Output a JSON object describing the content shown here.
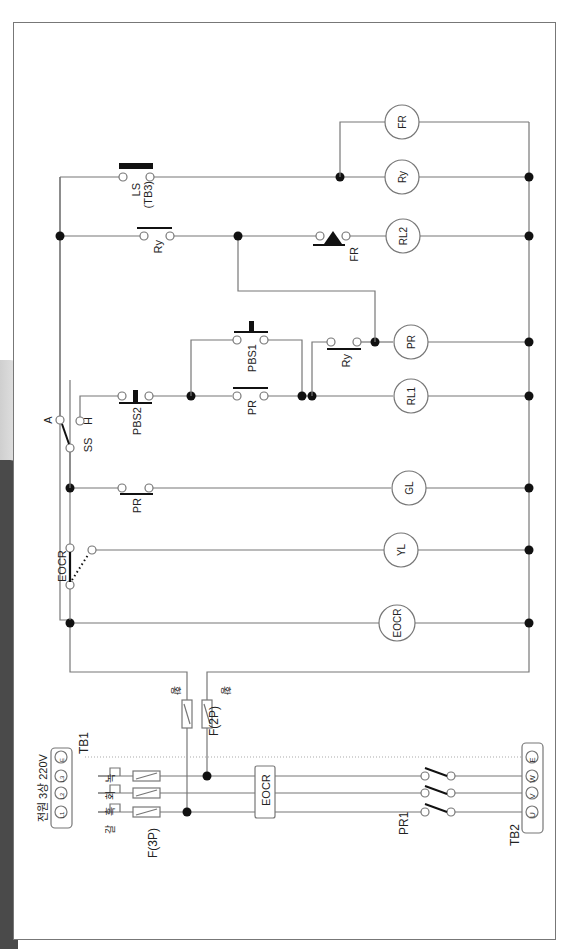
{
  "diagram": {
    "type": "electrical control circuit (sequence diagram, rotated 90°)",
    "power_supply": {
      "label": "전원 3상 220V",
      "terminal_block": "TB1",
      "terminals": [
        "L1",
        "L2",
        "L3",
        "E"
      ],
      "wire_colors": [
        "갈",
        "흑",
        "회",
        "녹"
      ]
    },
    "main_circuit": {
      "fuse_3p": "F(3P)",
      "overload_relay": "EOCR",
      "contactor": "PR1",
      "output_terminal_block": "TB2",
      "output_terminals": [
        "U",
        "V",
        "W",
        "E"
      ]
    },
    "control_fuses": {
      "label": "F(2P)",
      "wire_color_labels": [
        "황",
        "황"
      ]
    },
    "control_components": {
      "ocr_contact": "EOCR",
      "selector_switch": "SS",
      "ss_positions": [
        "A",
        "H"
      ],
      "pr_no_contact": "PR",
      "pbs2": "PBS2",
      "pbs1": "PBS1",
      "pr_self_hold": "PR",
      "ry_contact_1": "Ry",
      "ry_contact_2": "Ry",
      "fr_contact": "FR",
      "limit_switch": "LS",
      "limit_switch_tb": "(TB3)"
    },
    "loads": [
      "EOCR",
      "YL",
      "GL",
      "RL1",
      "PR",
      "RL2",
      "Ry",
      "FR"
    ]
  }
}
